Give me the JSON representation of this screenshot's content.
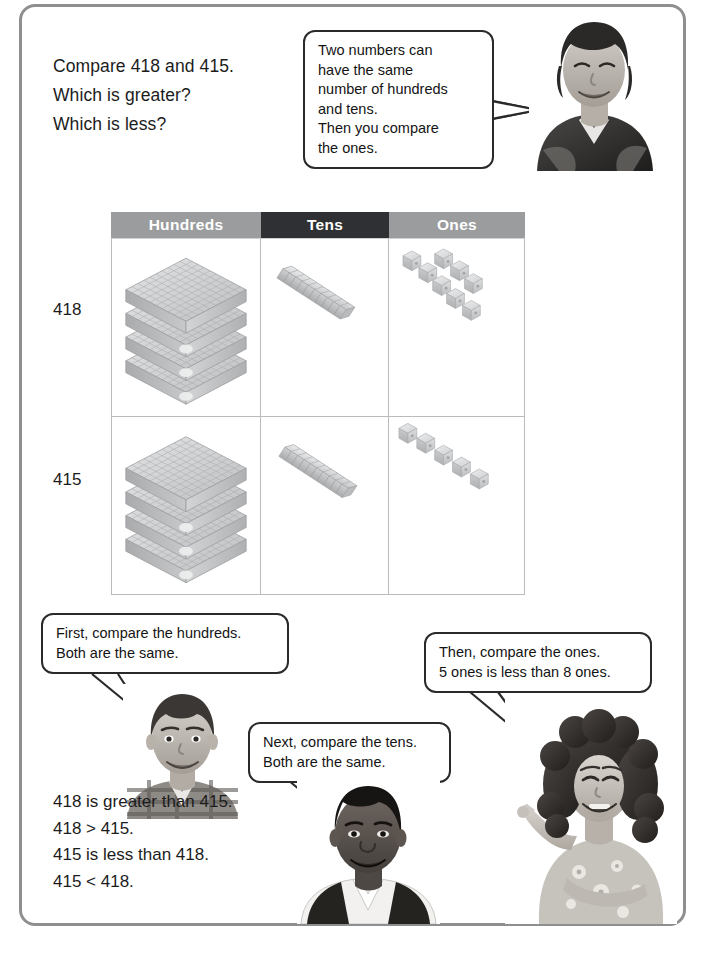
{
  "page": {
    "border_color": "#8d8f90",
    "background": "#ffffff"
  },
  "question": {
    "lines": [
      "Compare 418 and 415.",
      "Which is greater?",
      "Which is less?"
    ]
  },
  "bubbles": {
    "top": {
      "speaker": "boy-photo-top",
      "lines": [
        "Two numbers can",
        "have the same",
        "number of hundreds",
        "and tens.",
        "Then you compare",
        "the ones."
      ]
    },
    "hundreds": {
      "speaker": "boy-photo-hundreds",
      "lines": [
        "First, compare the hundreds.",
        "Both are the same."
      ]
    },
    "tens": {
      "speaker": "boy-photo-tens",
      "lines": [
        "Next, compare the tens.",
        "Both are the same."
      ]
    },
    "ones": {
      "speaker": "girl-photo-ones",
      "lines": [
        "Then, compare the ones.",
        "5 ones is less than 8 ones."
      ]
    }
  },
  "table": {
    "headers": [
      "Hundreds",
      "Tens",
      "Ones"
    ],
    "header_colors": {
      "hundreds": "#9b9c9e",
      "tens": "#2f3033",
      "ones": "#9b9c9e"
    },
    "rows": [
      {
        "label": "418",
        "hundreds_flats": 4,
        "tens_rods": 1,
        "ones_cubes": 8
      },
      {
        "label": "415",
        "hundreds_flats": 4,
        "tens_rods": 1,
        "ones_cubes": 5
      }
    ],
    "block_color": "#c9cacb"
  },
  "conclusion": {
    "lines": [
      "418 is greater than 415.",
      "418 > 415.",
      "415 is less than 418.",
      "415 < 418."
    ]
  }
}
